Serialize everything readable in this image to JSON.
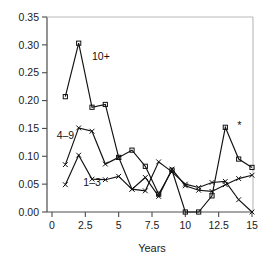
{
  "chart_data": {
    "type": "line",
    "title": "",
    "xlabel": "Years",
    "ylabel": "",
    "xlim": [
      0,
      15
    ],
    "ylim": [
      0.0,
      0.35
    ],
    "grid": false,
    "legend": "inline-labels",
    "x_ticks": [
      "0",
      "2.5",
      "5",
      "7.5",
      "10",
      "12.5",
      "15"
    ],
    "x_tick_values": [
      0,
      2.5,
      5,
      7.5,
      10,
      12.5,
      15
    ],
    "y_ticks": [
      "0.00",
      "0.05",
      "0.10",
      "0.15",
      "0.20",
      "0.25",
      "0.30",
      "0.35"
    ],
    "y_tick_values": [
      0.0,
      0.05,
      0.1,
      0.15,
      0.2,
      0.25,
      0.3,
      0.35
    ],
    "x": [
      1,
      2,
      3,
      4,
      5,
      6,
      7,
      8,
      9,
      10,
      11,
      12,
      13,
      14,
      15
    ],
    "series": [
      {
        "name": "10+",
        "marker": "square",
        "label_x": 3.0,
        "label_y": 0.272,
        "values": [
          0.207,
          0.303,
          0.188,
          0.193,
          0.098,
          0.111,
          0.082,
          0.032,
          0.075,
          0.0,
          0.0,
          0.029,
          0.152,
          0.095,
          0.08
        ]
      },
      {
        "name": "4–9",
        "marker": "cross",
        "label_x": 0.35,
        "label_y": 0.131,
        "values": [
          0.085,
          0.151,
          0.145,
          0.086,
          0.098,
          0.041,
          0.038,
          0.09,
          0.072,
          0.05,
          0.044,
          0.053,
          0.055,
          0.022,
          0.0
        ]
      },
      {
        "name": "1–3",
        "marker": "cross",
        "label_x": 2.35,
        "label_y": 0.047,
        "values": [
          0.049,
          0.102,
          0.059,
          0.058,
          0.064,
          0.041,
          0.062,
          0.028,
          0.077,
          0.047,
          0.039,
          0.037,
          0.049,
          0.06,
          0.066
        ]
      }
    ],
    "annotations": [
      {
        "text": "*",
        "x": 14.05,
        "y": 0.157
      }
    ]
  }
}
